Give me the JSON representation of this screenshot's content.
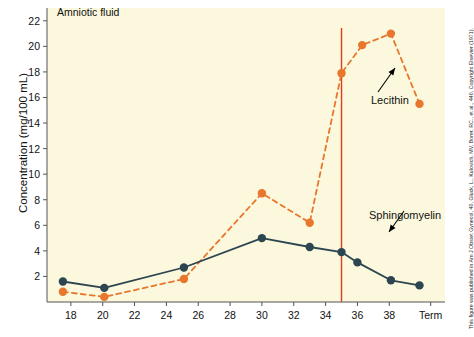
{
  "figure": {
    "panel_label": "Amniotic fluid",
    "credit": "This figure was published in Am J Obstet Gynecol, 40, Gluck, L., Kulovich, MV, Borer, RC., et al., 440, Copyright Elsevier (1971).",
    "background_color": "#fbf8dd",
    "page_color": "#ffffff"
  },
  "chart_data": {
    "type": "line",
    "title": "Amniotic fluid",
    "xlabel": "",
    "ylabel": "Concentration (mg/100 mL)",
    "xlim": [
      16.5,
      41.5
    ],
    "ylim": [
      0,
      23
    ],
    "x_tick_labels": [
      "18",
      "20",
      "22",
      "24",
      "26",
      "28",
      "30",
      "32",
      "34",
      "36",
      "38",
      "Term"
    ],
    "x_tick_values": [
      18,
      20,
      22,
      24,
      26,
      28,
      30,
      32,
      34,
      36,
      38,
      40.6
    ],
    "y_tick_labels": [
      "2",
      "4",
      "6",
      "8",
      "10",
      "12",
      "14",
      "16",
      "18",
      "20",
      "22"
    ],
    "y_tick_values": [
      2,
      4,
      6,
      8,
      10,
      12,
      14,
      16,
      18,
      20,
      22
    ],
    "grid": false,
    "legend": "inline-annotations",
    "series": [
      {
        "name": "Lecithin",
        "color": "#e8762c",
        "line_style": "dashed",
        "marker": "circle",
        "x": [
          17.5,
          20.1,
          25.1,
          30.0,
          33.0,
          35.0,
          36.3,
          38.1,
          39.9
        ],
        "values": [
          0.8,
          0.4,
          1.8,
          8.5,
          6.2,
          17.9,
          20.1,
          21.0,
          15.5
        ]
      },
      {
        "name": "Sphingomyelin",
        "color": "#2d4550",
        "line_style": "solid",
        "marker": "circle",
        "x": [
          17.5,
          20.1,
          25.1,
          30.0,
          33.0,
          35.0,
          36.0,
          38.1,
          39.9
        ],
        "values": [
          1.6,
          1.1,
          2.7,
          5.0,
          4.3,
          3.9,
          3.1,
          1.7,
          1.3
        ]
      }
    ],
    "annotations": [
      {
        "name": "Lecithin",
        "text": "Lecithin",
        "x": 38.0,
        "y": 19.2
      },
      {
        "name": "Sphingomyelin",
        "text": "Sphingomyelin",
        "x": 36.2,
        "y": 3.6
      }
    ],
    "reference_lines": [
      {
        "name": "week-35-marker",
        "orientation": "vertical",
        "x": 35.0,
        "color": "#e03c1e"
      }
    ]
  }
}
